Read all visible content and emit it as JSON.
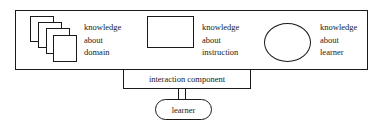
{
  "diagram": {
    "system_box": {
      "components": [
        {
          "id": "domain",
          "shape": "stacked-squares",
          "lines": [
            "knowledge",
            "about",
            "domain"
          ]
        },
        {
          "id": "instruction",
          "shape": "rectangle",
          "lines": [
            "knowledge",
            "about",
            "instruction"
          ]
        },
        {
          "id": "learner-model",
          "shape": "ellipse",
          "lines": [
            "knowledge",
            "about",
            "learner"
          ]
        }
      ]
    },
    "interaction_component": {
      "label": "interaction component"
    },
    "learner": {
      "label": "learner"
    },
    "colors": {
      "stroke": "#1a1a1a",
      "background": "#ffffff"
    }
  }
}
